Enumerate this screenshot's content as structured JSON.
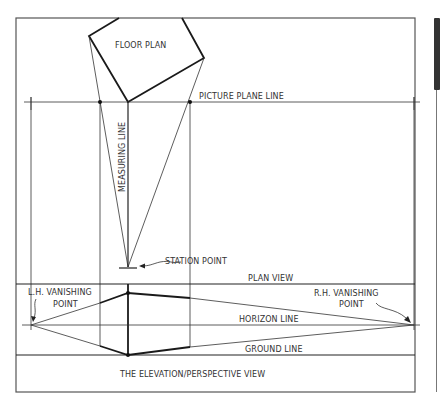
{
  "diagram": {
    "type": "two-point perspective construction",
    "labels": {
      "floor_plan": "FLOOR PLAN",
      "picture_plane_line": "PICTURE PLANE LINE",
      "measuring_line": "MEASURING LINE",
      "station_point": "STATION POINT",
      "plan_view": "PLAN VIEW",
      "lh_vanishing_line1": "L.H. VANISHING",
      "lh_vanishing_line2": "POINT",
      "rh_vanishing_line1": "R.H. VANISHING",
      "rh_vanishing_line2": "POINT",
      "horizon_line": "HORIZON LINE",
      "ground_line": "GROUND LINE",
      "elevation_view": "THE ELEVATION/PERSPECTIVE VIEW"
    },
    "colors": {
      "line": "#222222",
      "frame": "#555555",
      "text": "#333333",
      "scroll_thumb": "#333333"
    }
  }
}
